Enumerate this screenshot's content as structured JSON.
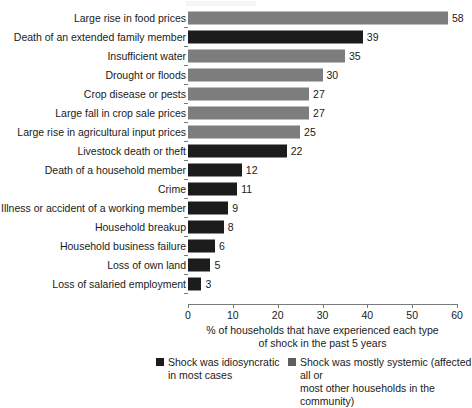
{
  "chart_data": {
    "type": "bar",
    "orientation": "horizontal",
    "title": "",
    "xlabel": "% of households that have experienced each type of shock in the past 5 years",
    "ylabel": "",
    "xlim": [
      0,
      60
    ],
    "xticks": [
      0,
      10,
      20,
      30,
      40,
      50,
      60
    ],
    "grid": false,
    "legend_position": "bottom",
    "categories": [
      "Large rise in food prices",
      "Death of an extended family member",
      "Insufficient water",
      "Drought or floods",
      "Crop disease or pests",
      "Large fall in crop sale prices",
      "Large rise in agricultural input prices",
      "Livestock death or theft",
      "Death of a household member",
      "Crime",
      "Illness or accident of a working member",
      "Household breakup",
      "Household business failure",
      "Loss of own land",
      "Loss of salaried employment"
    ],
    "values": [
      58,
      39,
      35,
      30,
      27,
      27,
      25,
      22,
      12,
      11,
      9,
      8,
      6,
      5,
      3
    ],
    "value_labels": [
      "58",
      "39",
      "35",
      "30",
      "27",
      "27",
      "25",
      "22",
      "12",
      "11",
      "9",
      "8",
      "6",
      "5",
      "3"
    ],
    "point_types": [
      "systemic",
      "idiosyncratic",
      "systemic",
      "systemic",
      "systemic",
      "systemic",
      "systemic",
      "idiosyncratic",
      "idiosyncratic",
      "idiosyncratic",
      "idiosyncratic",
      "idiosyncratic",
      "idiosyncratic",
      "idiosyncratic",
      "idiosyncratic"
    ],
    "series": [
      {
        "name": "Shock was idiosyncratic in most cases",
        "color": "#1c1c1c"
      },
      {
        "name": "Shock was mostly systemic (affected all or most other households in the community)",
        "color": "#7d7d7d"
      }
    ]
  },
  "axis": {
    "title_line1": "% of households that have experienced each type",
    "title_line2": "of shock in the past 5 years",
    "tick_labels": [
      "0",
      "10",
      "20",
      "30",
      "40",
      "50",
      "60"
    ]
  },
  "legend": {
    "idiosyncratic": {
      "label": "Shock was idiosyncratic\nin most cases",
      "color": "#1c1c1c"
    },
    "systemic": {
      "label": "Shock was mostly systemic (affected all or\nmost other households in the community)",
      "color": "#5e5e5e"
    }
  }
}
